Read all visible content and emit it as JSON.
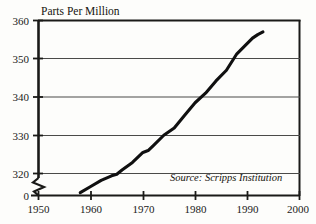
{
  "chart_data": {
    "type": "line",
    "title": "Parts Per Million",
    "xlabel": "",
    "ylabel": "Parts Per Million",
    "annotations": [
      "Source: Scripps Institution"
    ],
    "source_note": "Source: Scripps Institution",
    "grid": true,
    "legend": "none",
    "xlim": [
      1950,
      2000
    ],
    "ylim": [
      314,
      360
    ],
    "y_axis_break": true,
    "y_break_label": "0",
    "xticks": [
      1950,
      1960,
      1970,
      1980,
      1990,
      2000
    ],
    "xtick_labels": [
      "1950",
      "1960",
      "1970",
      "1980",
      "1990",
      "2000"
    ],
    "yticks": [
      320,
      330,
      340,
      350,
      360
    ],
    "ytick_labels": [
      "320",
      "330",
      "340",
      "350",
      "360"
    ],
    "series": [
      {
        "name": "Atmospheric CO2",
        "color": "#101010",
        "x": [
          1958,
          1960,
          1962,
          1964,
          1965,
          1966,
          1968,
          1970,
          1971,
          1972,
          1974,
          1976,
          1978,
          1980,
          1982,
          1984,
          1986,
          1988,
          1990,
          1991,
          1992,
          1993
        ],
        "values": [
          315.0,
          316.6,
          318.2,
          319.4,
          319.8,
          320.9,
          322.9,
          325.5,
          326.0,
          327.3,
          330.0,
          331.9,
          335.2,
          338.5,
          341.0,
          344.2,
          347.0,
          351.3,
          354.0,
          355.4,
          356.3,
          357.0
        ]
      }
    ]
  },
  "figure": {
    "title": "Parts Per Million",
    "source": "Source: Scripps Institution"
  }
}
